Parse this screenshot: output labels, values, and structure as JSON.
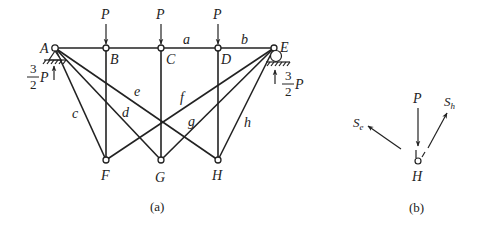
{
  "figure_a": {
    "caption": "(a)",
    "nodes": {
      "A": "A",
      "B": "B",
      "C": "C",
      "D": "D",
      "E": "E",
      "F": "F",
      "G": "G",
      "H": "H"
    },
    "members": {
      "a": "a",
      "b": "b",
      "c": "c",
      "d": "d",
      "e": "e",
      "f": "f",
      "g": "g",
      "h": "h"
    },
    "loads": [
      "P",
      "P",
      "P"
    ],
    "reactions": {
      "left": {
        "num": "3",
        "den": "2",
        "sym": "P"
      },
      "right": {
        "num": "3",
        "den": "2",
        "sym": "P"
      }
    }
  },
  "figure_b": {
    "caption": "(b)",
    "node": "H",
    "load": "P",
    "force_e": {
      "base": "S",
      "sub": "e"
    },
    "force_h": {
      "base": "S",
      "sub": "h"
    }
  },
  "colors": {
    "line": "#222222",
    "background": "#ffffff"
  }
}
